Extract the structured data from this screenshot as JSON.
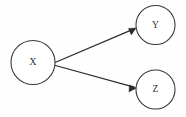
{
  "diagram": {
    "type": "directed-graph",
    "background_color": "#fefefe",
    "stroke_color": "#3a3a3a",
    "edge_color": "#2b2b2b",
    "label_color": "#2e2e2e",
    "nodes": [
      {
        "id": "X",
        "label": "X",
        "cx": 33,
        "cy": 62.5,
        "r": 22
      },
      {
        "id": "Y",
        "label": "Y",
        "cx": 155.5,
        "cy": 25,
        "r": 19.5
      },
      {
        "id": "Z",
        "label": "Z",
        "cx": 155.5,
        "cy": 89.5,
        "r": 19.5
      }
    ],
    "edges": [
      {
        "id": "x-to-y",
        "from": "X",
        "to": "Y",
        "label": "",
        "directed": true,
        "x1": 55,
        "y1": 62.5,
        "x2": 136,
        "y2": 28
      },
      {
        "id": "x-to-z",
        "from": "X",
        "to": "Z",
        "label": "",
        "directed": true,
        "x1": 55.5,
        "y1": 65.5,
        "x2": 136.5,
        "y2": 88
      }
    ]
  }
}
